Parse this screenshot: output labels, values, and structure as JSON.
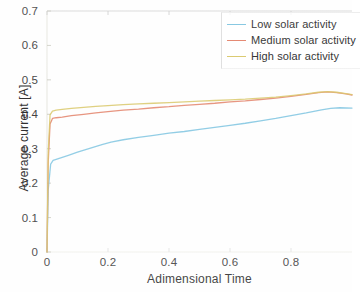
{
  "chart_data": {
    "type": "line",
    "title": "",
    "xlabel": "Adimensional Time",
    "ylabel": "Average current [A]",
    "xlim": [
      0,
      1
    ],
    "ylim": [
      0,
      0.7
    ],
    "xticks": [
      "0",
      "0.2",
      "0.4",
      "0.6",
      "0.8"
    ],
    "xtick_values": [
      0,
      0.2,
      0.4,
      0.6,
      0.8
    ],
    "yticks": [
      "0",
      "0.1",
      "0.2",
      "0.3",
      "0.4",
      "0.5",
      "0.6",
      "0.7"
    ],
    "ytick_values": [
      0,
      0.1,
      0.2,
      0.3,
      0.4,
      0.5,
      0.6,
      0.7
    ],
    "grid": false,
    "legend_position": "top-right",
    "series": [
      {
        "name": "Low solar activity",
        "color": "#7ec4e0",
        "x": [
          0,
          0.004,
          0.012,
          0.02,
          0.04,
          0.07,
          0.1,
          0.14,
          0.18,
          0.21,
          0.25,
          0.3,
          0.35,
          0.4,
          0.45,
          0.5,
          0.55,
          0.6,
          0.65,
          0.7,
          0.75,
          0.8,
          0.85,
          0.9,
          0.93,
          0.96,
          1.0
        ],
        "y": [
          0,
          0.18,
          0.255,
          0.266,
          0.272,
          0.281,
          0.29,
          0.301,
          0.312,
          0.319,
          0.326,
          0.333,
          0.339,
          0.345,
          0.35,
          0.356,
          0.362,
          0.368,
          0.374,
          0.381,
          0.388,
          0.396,
          0.404,
          0.413,
          0.417,
          0.419,
          0.418
        ]
      },
      {
        "name": "Medium solar activity",
        "color": "#e3826a",
        "x": [
          0,
          0.004,
          0.01,
          0.018,
          0.03,
          0.05,
          0.08,
          0.12,
          0.16,
          0.2,
          0.25,
          0.3,
          0.35,
          0.4,
          0.45,
          0.5,
          0.55,
          0.6,
          0.65,
          0.7,
          0.75,
          0.8,
          0.85,
          0.89,
          0.92,
          0.95,
          0.98,
          1.0
        ],
        "y": [
          0,
          0.26,
          0.372,
          0.388,
          0.39,
          0.392,
          0.396,
          0.4,
          0.404,
          0.408,
          0.412,
          0.415,
          0.419,
          0.422,
          0.426,
          0.429,
          0.432,
          0.436,
          0.439,
          0.443,
          0.447,
          0.452,
          0.458,
          0.463,
          0.465,
          0.463,
          0.459,
          0.456
        ]
      },
      {
        "name": "High solar activity",
        "color": "#d9c86a",
        "x": [
          0,
          0.004,
          0.01,
          0.018,
          0.03,
          0.05,
          0.08,
          0.12,
          0.16,
          0.2,
          0.25,
          0.3,
          0.35,
          0.4,
          0.45,
          0.5,
          0.55,
          0.6,
          0.65,
          0.7,
          0.75,
          0.8,
          0.85,
          0.89,
          0.92,
          0.95,
          0.98,
          1.0
        ],
        "y": [
          0,
          0.29,
          0.398,
          0.409,
          0.412,
          0.414,
          0.417,
          0.42,
          0.423,
          0.425,
          0.428,
          0.43,
          0.432,
          0.434,
          0.436,
          0.438,
          0.44,
          0.442,
          0.444,
          0.447,
          0.45,
          0.454,
          0.459,
          0.464,
          0.466,
          0.464,
          0.46,
          0.457
        ]
      }
    ]
  },
  "legend": {
    "items": [
      {
        "label": "Low solar activity"
      },
      {
        "label": "Medium solar activity"
      },
      {
        "label": "High solar activity"
      }
    ]
  },
  "axes": {
    "x_title": "Adimensional Time",
    "y_title": "Average current [A]"
  }
}
